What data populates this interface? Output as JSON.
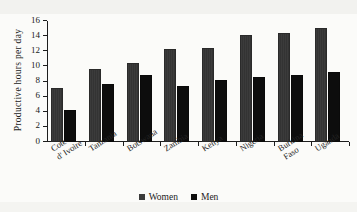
{
  "chart_data": {
    "type": "bar",
    "title": "",
    "subtitle": "",
    "xlabel": "",
    "ylabel": "Productive hours per day",
    "ylim": [
      0,
      16
    ],
    "ytick_step": 2,
    "yticks": [
      16,
      14,
      12,
      10,
      8,
      6,
      4,
      2,
      0
    ],
    "grid": false,
    "legend_position": "bottom-center",
    "categories": [
      "Cote\nd' Ivoire",
      "Tanzania",
      "Botswana",
      "Zambia",
      "Kenya",
      "Nigeria",
      "Burkina\nFaso",
      "Uganda"
    ],
    "series": [
      {
        "name": "Women",
        "color": "#3b3b3b",
        "values": [
          7.1,
          9.6,
          10.4,
          12.3,
          12.4,
          14.1,
          14.4,
          15.1
        ]
      },
      {
        "name": "Men",
        "color": "#0d0d0d",
        "values": [
          4.2,
          7.7,
          8.9,
          7.4,
          8.2,
          8.6,
          8.8,
          9.2
        ]
      }
    ]
  },
  "legend": {
    "items": [
      {
        "label": "Women",
        "swatch": "women"
      },
      {
        "label": "Men",
        "swatch": "men"
      }
    ]
  },
  "colors": {
    "background": "#fbfbf9",
    "axis": "#1d1d1d",
    "women_bar": "#3b3b3b",
    "men_bar": "#0d0d0d",
    "text": "#1f1f1f"
  }
}
